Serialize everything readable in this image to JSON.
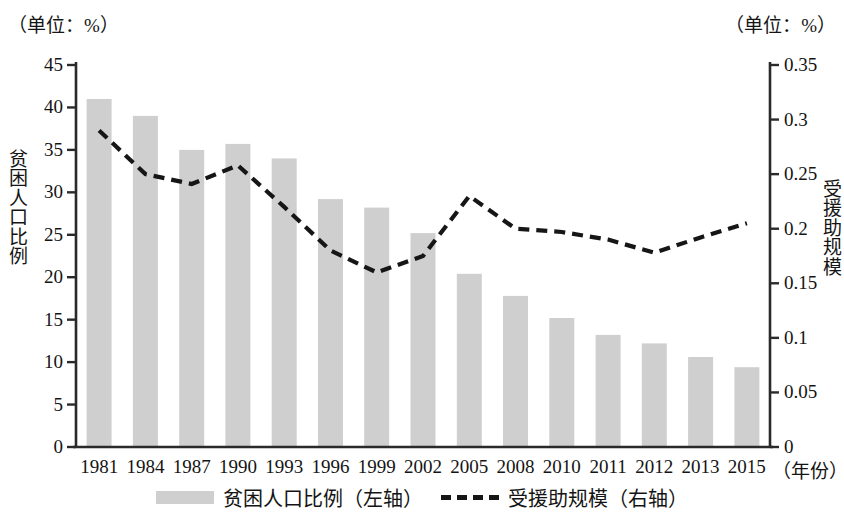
{
  "units": {
    "left": "（单位：%）",
    "right": "（单位：%）"
  },
  "axis_titles": {
    "left": "贫困人口比例",
    "right": "受援助规模"
  },
  "x_axis_unit": "（年份）",
  "legend": {
    "bar_label": "贫困人口比例（左轴）",
    "line_label": "受援助规模（右轴）"
  },
  "colors": {
    "bar": "#cfcfcf",
    "line": "#161616",
    "axis": "#2a2a2a",
    "text": "#141414"
  },
  "chart_data": {
    "type": "bar",
    "title": "",
    "xlabel": "（年份）",
    "ylabel": "贫困人口比例",
    "categories": [
      "1981",
      "1984",
      "1987",
      "1990",
      "1993",
      "1996",
      "1999",
      "2002",
      "2005",
      "2008",
      "2010",
      "2011",
      "2012",
      "2013",
      "2015"
    ],
    "grid": false,
    "legend_position": "bottom",
    "series": [
      {
        "name": "贫困人口比例（左轴）",
        "type": "bar",
        "axis": "left",
        "unit": "%",
        "values": [
          41,
          39,
          35,
          35.7,
          34,
          29.2,
          28.2,
          25.2,
          20.4,
          17.8,
          15.2,
          13.2,
          12.2,
          10.6,
          9.4
        ]
      },
      {
        "name": "受援助规模（右轴）",
        "type": "line",
        "axis": "right",
        "unit": "%",
        "style": "dashed",
        "values": [
          0.29,
          0.25,
          0.241,
          0.258,
          0.22,
          0.18,
          0.16,
          0.175,
          0.23,
          0.2,
          0.197,
          0.19,
          0.178,
          0.192,
          0.205
        ]
      }
    ],
    "left_axis": {
      "ticks": [
        0,
        5,
        10,
        15,
        20,
        25,
        30,
        35,
        40,
        45
      ],
      "tick_labels": [
        "0",
        "5",
        "10",
        "15",
        "20",
        "25",
        "30",
        "35",
        "40",
        "45"
      ],
      "ylim": [
        0,
        45
      ],
      "unit": "（单位：%）"
    },
    "right_axis": {
      "ticks": [
        0,
        0.05,
        0.1,
        0.15,
        0.2,
        0.25,
        0.3,
        0.35
      ],
      "tick_labels": [
        "0",
        "0.05",
        "0.1",
        "0.15",
        "0.2",
        "0.25",
        "0.3",
        "0.35"
      ],
      "ylim": [
        0,
        0.35
      ],
      "unit": "（单位：%）"
    }
  }
}
